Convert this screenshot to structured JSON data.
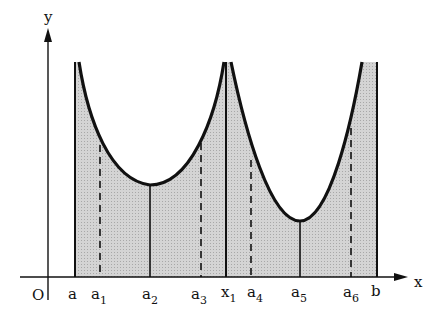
{
  "diagram": {
    "axes": {
      "y_label": "y",
      "x_label": "x",
      "origin_label": "O"
    },
    "x_labels": [
      {
        "base": "a",
        "sub": "",
        "x": 75
      },
      {
        "base": "a",
        "sub": "1",
        "x": 100
      },
      {
        "base": "a",
        "sub": "2",
        "x": 150
      },
      {
        "base": "a",
        "sub": "3",
        "x": 201
      },
      {
        "base": "x",
        "sub": "1",
        "x": 226
      },
      {
        "base": "a",
        "sub": "4",
        "x": 251
      },
      {
        "base": "a",
        "sub": "5",
        "x": 300
      },
      {
        "base": "a",
        "sub": "6",
        "x": 351
      },
      {
        "base": "b",
        "sub": "",
        "x": 377
      }
    ],
    "fill_color": "#c8c8c8",
    "curve_color": "#111111"
  }
}
